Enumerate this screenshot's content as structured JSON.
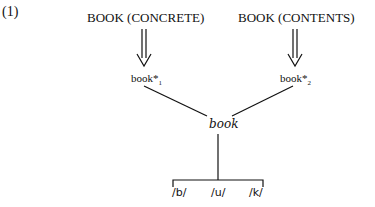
{
  "example_number": "(1)",
  "concepts": [
    {
      "label": "BOOK (CONCRETE)"
    },
    {
      "label": "BOOK (CONTENTS)"
    }
  ],
  "lexemes": [
    {
      "label": "book*",
      "index": "1"
    },
    {
      "label": "book*",
      "index": "2"
    }
  ],
  "word": "book",
  "phonemes": [
    "/b/",
    "/u/",
    "/k/"
  ]
}
